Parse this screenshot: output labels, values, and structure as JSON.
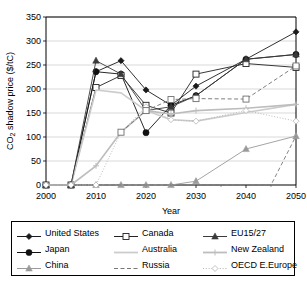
{
  "chart_data": {
    "type": "line",
    "title": "",
    "xlabel": "Year",
    "ylabel": "CO2 shadow price ($/tC)",
    "ylabel_html": "CO₂ shadow price ($/tC)",
    "xlim": [
      2000,
      2050
    ],
    "ylim": [
      0,
      350
    ],
    "ytick_step": 50,
    "xtick_step": 10,
    "xticks": [
      "2000",
      "2010",
      "2020",
      "2030",
      "2040",
      "2050"
    ],
    "yticks": [
      "0",
      "50",
      "100",
      "150",
      "200",
      "250",
      "300",
      "350"
    ],
    "grid": "horizontal",
    "legend_position": "below",
    "series": [
      {
        "name": "United States",
        "color": "#1a1a1a",
        "marker": "diamond-filled",
        "dash": "solid",
        "x": [
          2000,
          2005,
          2010,
          2015,
          2020,
          2025,
          2030,
          2040,
          2050
        ],
        "values": [
          0,
          0,
          236,
          259,
          198,
          166,
          206,
          262,
          319
        ]
      },
      {
        "name": "Japan",
        "color": "#111111",
        "marker": "circle-filled",
        "dash": "solid",
        "x": [
          2000,
          2005,
          2010,
          2015,
          2020,
          2025,
          2030,
          2040,
          2050
        ],
        "values": [
          0,
          0,
          236,
          231,
          109,
          166,
          186,
          262,
          272
        ]
      },
      {
        "name": "China",
        "color": "#9a9a9a",
        "marker": "triangle-filled",
        "dash": "solid",
        "x": [
          2000,
          2005,
          2010,
          2015,
          2020,
          2025,
          2030,
          2040,
          2050
        ],
        "values": [
          0,
          0,
          0,
          0,
          0,
          0,
          8,
          75,
          102
        ]
      },
      {
        "name": "Canada",
        "color": "#222222",
        "marker": "square-open",
        "dash": "solid",
        "x": [
          2000,
          2005,
          2010,
          2015,
          2020,
          2025,
          2030,
          2040,
          2050
        ],
        "values": [
          0,
          0,
          203,
          228,
          166,
          150,
          231,
          253,
          245
        ]
      },
      {
        "name": "Australia",
        "color": "#cccccc",
        "marker": "none",
        "dash": "solid",
        "x": [
          2000,
          2005,
          2010,
          2015,
          2020,
          2025,
          2030,
          2040,
          2050
        ],
        "values": [
          0,
          0,
          198,
          192,
          155,
          136,
          133,
          151,
          168
        ]
      },
      {
        "name": "Russia",
        "color": "#777777",
        "marker": "none",
        "dash": "dashed",
        "x": [
          2000,
          2005,
          2010,
          2015,
          2020,
          2025,
          2030,
          2040,
          2045,
          2050
        ],
        "values": [
          0,
          0,
          0,
          0,
          0,
          0,
          0,
          0,
          0,
          102
        ]
      },
      {
        "name": "EU15/27",
        "color": "#3a3a3a",
        "marker": "triangle-filled",
        "dash": "solid",
        "x": [
          2000,
          2005,
          2010,
          2015,
          2020,
          2025,
          2030,
          2040,
          2050
        ],
        "values": [
          0,
          0,
          259,
          231,
          155,
          163,
          186,
          262,
          272
        ]
      },
      {
        "name": "New Zealand",
        "color": "#bdbdbd",
        "marker": "plus",
        "dash": "solid",
        "x": [
          2000,
          2005,
          2010,
          2015,
          2020,
          2025,
          2030,
          2040,
          2050
        ],
        "values": [
          0,
          0,
          40,
          110,
          155,
          148,
          155,
          160,
          168
        ]
      },
      {
        "name": "OECD E.Europe",
        "color": "#b5b5b5",
        "marker": "diamond-open",
        "dash": "dotted",
        "x": [
          2000,
          2005,
          2010,
          2015,
          2020,
          2025,
          2030,
          2040,
          2050
        ],
        "values": [
          0,
          0,
          0,
          110,
          163,
          136,
          133,
          155,
          133
        ]
      },
      {
        "name": "Russia-dashed-upper",
        "color": "#6f6f6f",
        "marker": "square-open",
        "dash": "dashed",
        "x": [
          2015,
          2020,
          2025,
          2030,
          2040,
          2050
        ],
        "values": [
          110,
          155,
          178,
          180,
          179,
          248
        ]
      }
    ]
  },
  "legend": {
    "rows": [
      [
        {
          "label": "United States",
          "key": "diamond-filled",
          "color": "#1a1a1a",
          "dash": "solid"
        },
        {
          "label": "Canada",
          "key": "square-open",
          "color": "#222222",
          "dash": "solid"
        },
        {
          "label": "EU15/27",
          "key": "triangle-filled",
          "color": "#3a3a3a",
          "dash": "solid"
        }
      ],
      [
        {
          "label": "Japan",
          "key": "circle-filled",
          "color": "#111111",
          "dash": "solid"
        },
        {
          "label": "Australia",
          "key": "none",
          "color": "#cccccc",
          "dash": "solid"
        },
        {
          "label": "New Zealand",
          "key": "plus",
          "color": "#bdbdbd",
          "dash": "solid"
        }
      ],
      [
        {
          "label": "China",
          "key": "triangle-filled",
          "color": "#9a9a9a",
          "dash": "solid"
        },
        {
          "label": "Russia",
          "key": "none",
          "color": "#777777",
          "dash": "dashed"
        },
        {
          "label": "OECD E.Europe",
          "key": "diamond-open",
          "color": "#b5b5b5",
          "dash": "dotted"
        }
      ]
    ]
  }
}
